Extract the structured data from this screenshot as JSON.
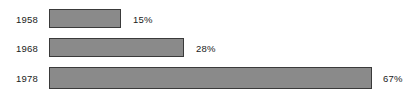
{
  "chart_data": {
    "type": "bar",
    "orientation": "horizontal",
    "title": "",
    "subtitle": "",
    "xlabel": "",
    "ylabel": "",
    "categories": [
      "1958",
      "1968",
      "1978"
    ],
    "values": [
      15,
      28,
      67
    ],
    "value_labels": [
      "15%",
      "28%",
      "67%"
    ],
    "xlim": [
      0,
      75
    ],
    "grid": false,
    "legend": null,
    "axis_visible": false,
    "bars": [
      {
        "category": "1958",
        "value": 15,
        "value_label": "15%",
        "pixel_start": 49,
        "pixel_end": 121,
        "pixel_width": 72,
        "pixel_top": 9,
        "pixel_height": 19,
        "label_left": 133
      },
      {
        "category": "1968",
        "value": 28,
        "value_label": "28%",
        "pixel_start": 49,
        "pixel_end": 184,
        "pixel_width": 135,
        "pixel_top": 38,
        "pixel_height": 19,
        "label_left": 196
      },
      {
        "category": "1978",
        "value": 67,
        "value_label": "67%",
        "pixel_start": 49,
        "pixel_end": 372,
        "pixel_width": 323,
        "pixel_top": 67,
        "pixel_height": 22,
        "label_left": 383
      }
    ],
    "colors": {
      "bar_fill": "#8a8a8a",
      "bar_border": "#3a3a3a",
      "background": "#ffffff",
      "text": "#1a1a1a"
    }
  }
}
